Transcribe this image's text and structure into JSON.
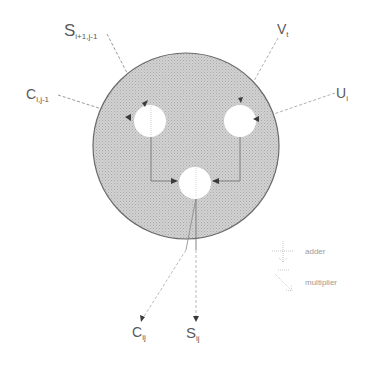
{
  "diagram": {
    "type": "processing-cell",
    "colors": {
      "cell_fill": "#c8c8c8",
      "cell_stroke": "#6a6a6a",
      "unit_fill": "#ffffff",
      "wire": "#8a8a8a",
      "arrow": "#3a3a3a",
      "label": "#5a5a5a",
      "legend": "#a0a0a0"
    },
    "inputs": [
      {
        "id": "s_in",
        "main": "S",
        "sub": "i+1,j-1"
      },
      {
        "id": "v_in",
        "main": "V",
        "sub": "t"
      },
      {
        "id": "c_in",
        "main": "C",
        "sub": "i,j-1"
      },
      {
        "id": "u_in",
        "main": "U",
        "sub": "i"
      }
    ],
    "outputs": [
      {
        "id": "c_out",
        "main": "C",
        "sub": "ij"
      },
      {
        "id": "s_out",
        "main": "S",
        "sub": "ij"
      }
    ],
    "units": [
      {
        "id": "left-unit",
        "kind": "adder"
      },
      {
        "id": "right-unit",
        "kind": "multiplier"
      },
      {
        "id": "bottom-unit",
        "kind": "adder"
      }
    ],
    "legend": [
      {
        "symbol": "adder-symbol",
        "label": "adder"
      },
      {
        "symbol": "multiplier-symbol",
        "label": "multiplier"
      }
    ]
  }
}
